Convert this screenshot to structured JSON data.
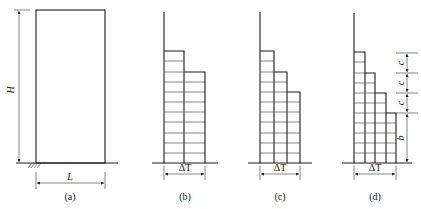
{
  "figure": {
    "panels": [
      {
        "id": "a",
        "caption": "(a)",
        "height_label": "H",
        "width_label": "L"
      },
      {
        "id": "b",
        "caption": "(b)",
        "width_label": "ΔT",
        "steps": 2
      },
      {
        "id": "c",
        "caption": "(c)",
        "width_label": "ΔT",
        "steps": 3
      },
      {
        "id": "d",
        "caption": "(d)",
        "width_label": "ΔT",
        "steps": 4,
        "dimension_labels": [
          "c",
          "c",
          "c",
          "b"
        ]
      }
    ]
  },
  "colors": {
    "line": "#1a1a1a",
    "background": "#ffffff"
  }
}
